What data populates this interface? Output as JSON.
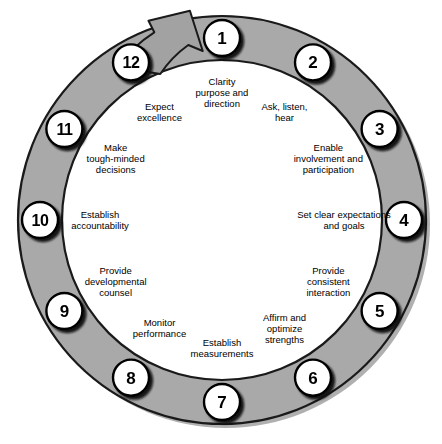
{
  "diagram": {
    "type": "cycle-ring",
    "direction": "clockwise",
    "arrow_label": "cycle-continuation-arrow",
    "colors": {
      "ring_fill": "#a9a9a9",
      "ring_stroke": "#1a1a1a",
      "ring_shadow": "#7a7a7a",
      "badge_fill": "#ffffff",
      "badge_stroke": "#000000",
      "badge_shadow": "#111111",
      "background": "#ffffff",
      "text": "#000000",
      "caption": "#b8b8b8"
    },
    "geometry": {
      "center_x": 222,
      "center_y": 220,
      "outer_radius": 204,
      "inner_radius": 160,
      "badge_radius": 18,
      "badge_orbit_radius": 182,
      "label_orbit_radius": 128
    },
    "steps": [
      {
        "number": "1",
        "angle_deg": 0,
        "label": "Clarity purpose and direction",
        "lines": [
          "Clarity",
          "purpose and",
          "direction"
        ]
      },
      {
        "number": "2",
        "angle_deg": 30,
        "label": "Ask, listen, hear",
        "lines": [
          "Ask, listen,",
          "hear"
        ]
      },
      {
        "number": "3",
        "angle_deg": 60,
        "label": "Enable involvement and participation",
        "lines": [
          "Enable",
          "involvement and",
          "participation"
        ]
      },
      {
        "number": "4",
        "angle_deg": 90,
        "label": "Set clear expectations and goals",
        "lines": [
          "Set clear expectations",
          "and goals"
        ]
      },
      {
        "number": "5",
        "angle_deg": 120,
        "label": "Provide consistent interaction",
        "lines": [
          "Provide",
          "consistent",
          "interaction"
        ]
      },
      {
        "number": "6",
        "angle_deg": 150,
        "label": "Affirm and optimize strengths",
        "lines": [
          "Affirm and",
          "optimize",
          "strengths"
        ]
      },
      {
        "number": "7",
        "angle_deg": 180,
        "label": "Establish measurements",
        "lines": [
          "Establish",
          "measurements"
        ]
      },
      {
        "number": "8",
        "angle_deg": 210,
        "label": "Monitor performance",
        "lines": [
          "Monitor",
          "performance"
        ]
      },
      {
        "number": "9",
        "angle_deg": 240,
        "label": "Provide developmental counsel",
        "lines": [
          "Provide",
          "developmental",
          "counsel"
        ]
      },
      {
        "number": "10",
        "angle_deg": 270,
        "label": "Establish accountability",
        "lines": [
          "Establish",
          "accountability"
        ]
      },
      {
        "number": "11",
        "angle_deg": 300,
        "label": "Make tough-minded decisions",
        "lines": [
          "Make",
          "tough-minded",
          "decisions"
        ]
      },
      {
        "number": "12",
        "angle_deg": 330,
        "label": "Expect excellence",
        "lines": [
          "Expect",
          "excellence"
        ]
      }
    ],
    "caption": ""
  }
}
